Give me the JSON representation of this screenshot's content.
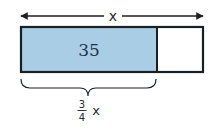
{
  "diagram": {
    "type": "tape-diagram",
    "total_label": "x",
    "shaded_value": "35",
    "fraction_numerator": "3",
    "fraction_denominator": "4",
    "fraction_variable": "x",
    "colors": {
      "shaded_fill": "#aacde6",
      "unshaded_fill": "#ffffff",
      "stroke": "#1a1f24"
    },
    "parts": {
      "total": 4,
      "shaded": 3
    }
  }
}
